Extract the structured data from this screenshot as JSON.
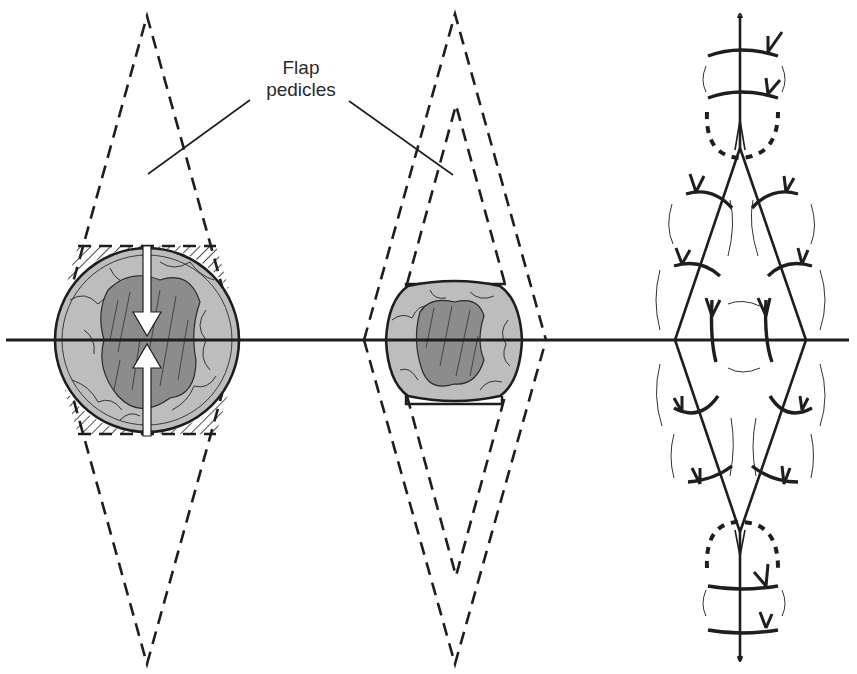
{
  "figure": {
    "type": "surgical-diagram"
  },
  "labels": {
    "flap_pedicles_line1": "Flap",
    "flap_pedicles_line2": "pedicles"
  },
  "colors": {
    "ink": "#1e1e1e",
    "defect_outer": "#b9b9b9",
    "defect_inner": "#8a8a8a",
    "background": "#ffffff",
    "arrow": "#ffffff"
  },
  "panels": [
    {
      "id": "left",
      "name": "Circular defect with planned rhomboid flap and closure arrows"
    },
    {
      "id": "middle",
      "name": "Defect trimmed with inner and outer flap outlines"
    },
    {
      "id": "right",
      "name": "Final sutured closure"
    }
  ]
}
